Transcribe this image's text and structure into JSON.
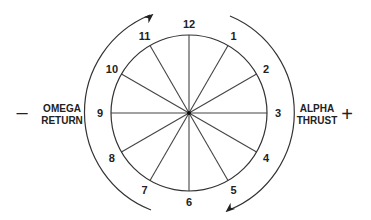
{
  "diagram": {
    "type": "clock-dial",
    "positions": [
      "12",
      "1",
      "2",
      "3",
      "4",
      "5",
      "6",
      "7",
      "8",
      "9",
      "10",
      "11"
    ],
    "left": {
      "sign": "–",
      "line1": "OMEGA",
      "line2": "RETURN"
    },
    "right": {
      "line1": "ALPHA",
      "line2": "THRUST",
      "sign": "+"
    },
    "colors": {
      "stroke": "#333333",
      "text": "#222222",
      "background": "#ffffff"
    }
  }
}
